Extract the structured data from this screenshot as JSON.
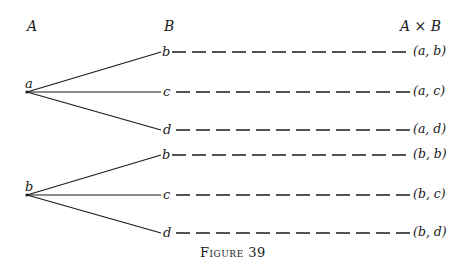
{
  "headers": {
    "set_a": "A",
    "set_b": "B",
    "product": "A × B"
  },
  "roots": [
    {
      "label": "a",
      "branches": [
        {
          "label": "b",
          "pair": "(a, b)"
        },
        {
          "label": "c",
          "pair": "(a, c)"
        },
        {
          "label": "d",
          "pair": "(a, d)"
        }
      ]
    },
    {
      "label": "b",
      "branches": [
        {
          "label": "b",
          "pair": "(b, b)"
        },
        {
          "label": "c",
          "pair": "(b, c)"
        },
        {
          "label": "d",
          "pair": "(b, d)"
        }
      ]
    }
  ],
  "caption": "Figure 39",
  "colors": {
    "ink": "#1a1a1a",
    "background": "#ffffff"
  }
}
